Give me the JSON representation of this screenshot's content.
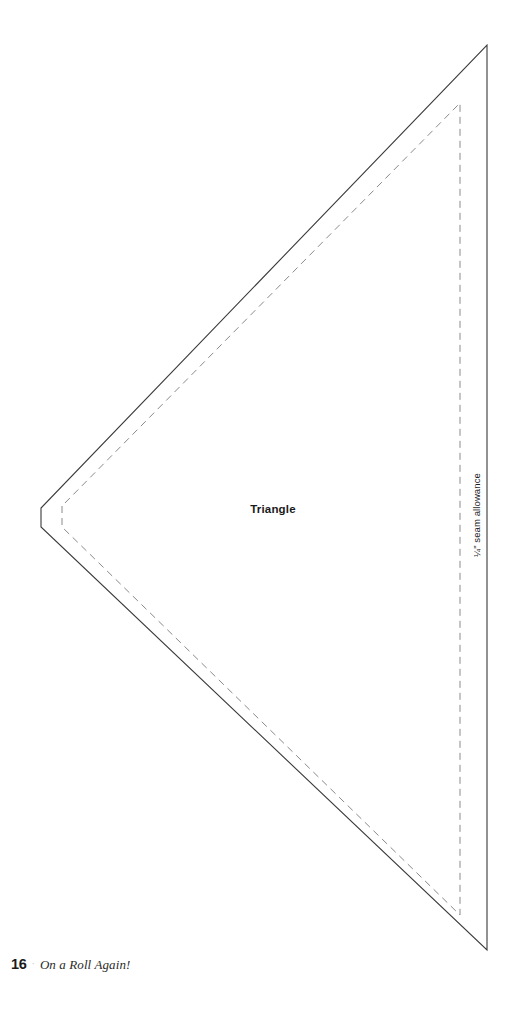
{
  "page": {
    "background_color": "#ffffff",
    "width": 509,
    "height": 1029
  },
  "template": {
    "piece_label": "Triangle",
    "seam_allowance_note": "¼\" seam allowance",
    "cut_line": {
      "name": "cutting-line",
      "style": "solid",
      "color": "#3a3a3a",
      "stroke_width": 1.1,
      "points": "41,508 41,527 487,950 487,45"
    },
    "stitch_line": {
      "name": "stitching-line",
      "style": "dashed",
      "color": "#8a8a8a",
      "stroke_width": 1.0,
      "dash": "7 5",
      "points": "62,506 62,527 460,915 460,103"
    }
  },
  "footer": {
    "page_number": "16",
    "separator": "·",
    "book_title": "On a Roll Again!"
  }
}
